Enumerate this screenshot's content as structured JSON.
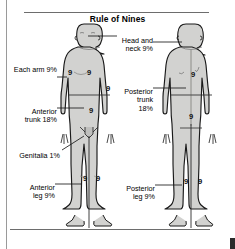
{
  "title": "Rule of Nines",
  "figures": {
    "anterior": {
      "name": "anterior-body-figure"
    },
    "posterior": {
      "name": "posterior-body-figure"
    }
  },
  "labels": [
    {
      "id": "head-neck",
      "text": "Head and\nneck 9%",
      "value": 9,
      "region": "Head and neck",
      "side": "right",
      "x": 118,
      "y": 31
    },
    {
      "id": "each-arm",
      "text": "Each arm 9%",
      "value": 9,
      "region": "Each arm",
      "side": "left",
      "x": 8,
      "y": 73
    },
    {
      "id": "anterior-trunk",
      "text": "Anterior\ntrunk 18%",
      "value": 18,
      "region": "Anterior trunk",
      "side": "left",
      "x": 21,
      "y": 104
    },
    {
      "id": "posterior-trunk",
      "text": "Posterior\ntrunk\n18%",
      "value": 18,
      "region": "Posterior trunk",
      "side": "right",
      "x": 114,
      "y": 83
    },
    {
      "id": "genitalia",
      "text": "Genitalia 1%",
      "value": 1,
      "region": "Genitalia",
      "side": "left",
      "x": 11,
      "y": 146
    },
    {
      "id": "anterior-leg",
      "text": "Anterior\nleg 9%",
      "value": 9,
      "region": "Anterior leg",
      "side": "left",
      "x": 21,
      "y": 180
    },
    {
      "id": "posterior-leg",
      "text": "Posterior\nleg 9%",
      "value": 9,
      "region": "Posterior leg",
      "side": "right",
      "x": 116,
      "y": 181
    }
  ],
  "markers": [
    {
      "id": "ant-left-arm",
      "text": "9",
      "x": 68,
      "y": 69
    },
    {
      "id": "ant-chest",
      "text": "9",
      "x": 87,
      "y": 69
    },
    {
      "id": "ant-right-arm",
      "text": "9",
      "x": 106,
      "y": 85
    },
    {
      "id": "ant-abdomen",
      "text": "9",
      "x": 89,
      "y": 107
    },
    {
      "id": "ant-left-leg",
      "text": "9",
      "x": 83,
      "y": 175
    },
    {
      "id": "ant-right-leg",
      "text": "9",
      "x": 96,
      "y": 175
    },
    {
      "id": "post-upper-back",
      "text": "9",
      "x": 191,
      "y": 71
    },
    {
      "id": "post-lower-back",
      "text": "9",
      "x": 189,
      "y": 113
    },
    {
      "id": "post-left-leg",
      "text": "9",
      "x": 184,
      "y": 178
    },
    {
      "id": "post-right-leg",
      "text": "9",
      "x": 198,
      "y": 178
    }
  ],
  "colors": {
    "skin_fill": "#d2d2d0",
    "skin_shade": "#bfbfbd",
    "outline": "#1a1a1a",
    "rule": "#6d6d6d",
    "text": "#000000"
  }
}
